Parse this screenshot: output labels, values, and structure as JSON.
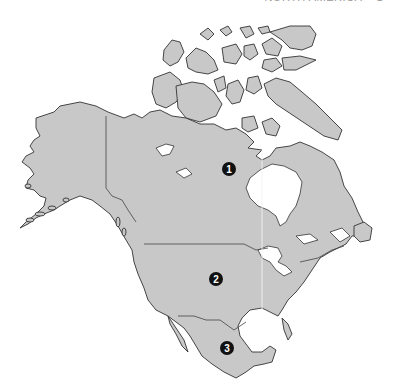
{
  "header": {
    "running_title": "NORTH AMERICA",
    "page_marker": "1"
  },
  "map": {
    "region": "North America",
    "colors": {
      "land": "#c8c8c8",
      "outline": "#333333",
      "water": "#ffffff",
      "marker": "#111111"
    },
    "markers": [
      {
        "id": 1,
        "label": "1",
        "location": "Canada",
        "x": 229,
        "y": 169
      },
      {
        "id": 2,
        "label": "2",
        "location": "United States",
        "x": 216,
        "y": 279
      },
      {
        "id": 3,
        "label": "3",
        "location": "Mexico",
        "x": 227,
        "y": 348
      }
    ]
  }
}
